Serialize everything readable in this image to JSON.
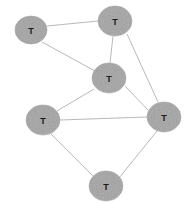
{
  "graph": {
    "background_color": "#ffffff",
    "node_fill_color": "#b0b0b0",
    "node_stroke_color": "#a8a8a8",
    "node_label_color": "#1a1a1a",
    "edge_color": "#b9b9b9",
    "node_count": 6,
    "edge_count": 9,
    "nodes": [
      {
        "id": "n1",
        "label": "T",
        "cx": 31,
        "cy": 30,
        "rx": 16,
        "ry": 14
      },
      {
        "id": "n2",
        "label": "T",
        "cx": 115,
        "cy": 21,
        "rx": 17,
        "ry": 15
      },
      {
        "id": "n3",
        "label": "T",
        "cx": 109,
        "cy": 78,
        "rx": 17,
        "ry": 15
      },
      {
        "id": "n4",
        "label": "T",
        "cx": 43,
        "cy": 120,
        "rx": 17,
        "ry": 15
      },
      {
        "id": "n5",
        "label": "T",
        "cx": 164,
        "cy": 117,
        "rx": 17,
        "ry": 15
      },
      {
        "id": "n6",
        "label": "T",
        "cx": 106,
        "cy": 186,
        "rx": 17,
        "ry": 15
      }
    ],
    "edges": [
      {
        "id": "e1",
        "source": "n1",
        "target": "n2",
        "x1": 47,
        "y1": 26,
        "x2": 98,
        "y2": 21
      },
      {
        "id": "e2",
        "source": "n1",
        "target": "n3",
        "x1": 42,
        "y1": 42,
        "x2": 95,
        "y2": 71
      },
      {
        "id": "e3",
        "source": "n2",
        "target": "n3",
        "x1": 113,
        "y1": 36,
        "x2": 110,
        "y2": 63
      },
      {
        "id": "e4",
        "source": "n2",
        "target": "n5",
        "x1": 127,
        "y1": 34,
        "x2": 158,
        "y2": 102
      },
      {
        "id": "e5",
        "source": "n3",
        "target": "n4",
        "x1": 94,
        "y1": 89,
        "x2": 57,
        "y2": 111
      },
      {
        "id": "e6",
        "source": "n3",
        "target": "n5",
        "x1": 125,
        "y1": 86,
        "x2": 148,
        "y2": 110
      },
      {
        "id": "e7",
        "source": "n4",
        "target": "n5",
        "x1": 60,
        "y1": 120,
        "x2": 147,
        "y2": 117
      },
      {
        "id": "e8",
        "source": "n4",
        "target": "n6",
        "x1": 51,
        "y1": 134,
        "x2": 94,
        "y2": 177
      },
      {
        "id": "e9",
        "source": "n5",
        "target": "n6",
        "x1": 157,
        "y1": 131,
        "x2": 119,
        "y2": 178
      }
    ]
  }
}
